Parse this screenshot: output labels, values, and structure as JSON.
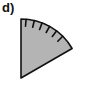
{
  "figure": {
    "label": "d)",
    "shape": "circular-sector",
    "sector_angle_deg": 60,
    "tick_count": 6,
    "colors": {
      "fill": "#b4b4b4",
      "stroke": "#111111",
      "background": "#ffffff"
    }
  }
}
